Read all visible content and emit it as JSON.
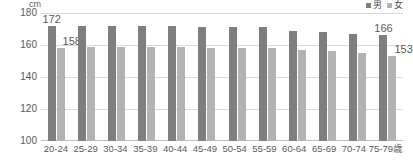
{
  "chart_data": {
    "type": "bar",
    "title": "",
    "xlabel": "",
    "ylabel": "cm",
    "unit_label": "cm",
    "ylim": [
      100,
      180
    ],
    "yticks": [
      100,
      120,
      140,
      160,
      180
    ],
    "ytick_labels": [
      "100",
      "120",
      "140",
      "160",
      "180"
    ],
    "grid": true,
    "legend_position": "top-right",
    "categories": [
      "20-24",
      "25-29",
      "30-34",
      "35-39",
      "40-44",
      "45-49",
      "50-54",
      "55-59",
      "60-64",
      "65-69",
      "70-74",
      "75-79歳"
    ],
    "series": [
      {
        "name": "男",
        "color": "#7f7f7f",
        "values": [
          172,
          172,
          172,
          172,
          172,
          171,
          171,
          171,
          169,
          168,
          167,
          166
        ]
      },
      {
        "name": "女",
        "color": "#b3b3b3",
        "values": [
          158,
          159,
          159,
          159,
          159,
          158,
          158,
          158,
          157,
          156,
          155,
          153
        ]
      }
    ],
    "data_labels": [
      {
        "series": "男",
        "category": "20-24",
        "value": 172,
        "text": "172"
      },
      {
        "series": "女",
        "category": "20-24",
        "value": 158,
        "text": "158"
      },
      {
        "series": "男",
        "category": "75-79歳",
        "value": 166,
        "text": "166"
      },
      {
        "series": "女",
        "category": "75-79歳",
        "value": 153,
        "text": "153"
      }
    ]
  },
  "legend": {
    "items": [
      {
        "label": "男",
        "color": "#7f7f7f"
      },
      {
        "label": "女",
        "color": "#b3b3b3"
      }
    ]
  },
  "colors": {
    "male": "#7f7f7f",
    "female": "#b3b3b3",
    "grid": "#d9d9d9",
    "text": "#5a5a5a",
    "background": "#ffffff"
  }
}
